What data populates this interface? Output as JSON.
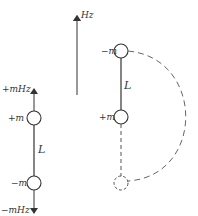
{
  "diagram": {
    "field_arrow": {
      "label": "Hz"
    },
    "left_dipole": {
      "top_force_label": "+mHz",
      "top_charge_label": "+m",
      "length_label": "L",
      "bottom_charge_label": "−m",
      "bottom_force_label": "−mHz"
    },
    "right_dipole": {
      "top_charge_label": "−m",
      "length_label": "L",
      "bottom_charge_label": "+m"
    },
    "colors": {
      "stroke": "#333333",
      "dashed": "#555555"
    }
  }
}
